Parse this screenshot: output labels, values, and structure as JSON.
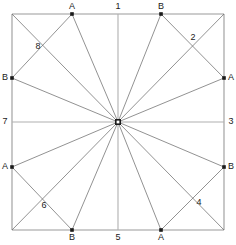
{
  "figure": {
    "type": "geometric-diagram",
    "canvas": {
      "width": 236,
      "height": 245
    },
    "colors": {
      "background": "#ffffff",
      "square_stroke": "#9a9a9a",
      "axis_stroke": "#b0b0b0",
      "ray_stroke": "#6e6e6e",
      "chord_stroke": "#6e6e6e",
      "node_fill": "#1a1a1a",
      "label_color": "#1a1a1a"
    },
    "square": {
      "left": 12,
      "top": 14,
      "right": 224,
      "bottom": 230
    },
    "center": {
      "x": 118,
      "y": 122,
      "label": ""
    }
  },
  "nodes": [
    {
      "id": "top-A",
      "label": "A",
      "x": 72,
      "y": 14,
      "lx": 72,
      "ly": 7
    },
    {
      "id": "top-B",
      "label": "B",
      "x": 161,
      "y": 14,
      "lx": 161,
      "ly": 7
    },
    {
      "id": "right-A",
      "label": "A",
      "x": 224,
      "y": 78,
      "lx": 231,
      "ly": 78
    },
    {
      "id": "right-B",
      "label": "B",
      "x": 224,
      "y": 167,
      "lx": 231,
      "ly": 167
    },
    {
      "id": "bottom-B",
      "label": "B",
      "x": 72,
      "y": 230,
      "lx": 72,
      "ly": 238
    },
    {
      "id": "bottom-A",
      "label": "A",
      "x": 161,
      "y": 230,
      "lx": 161,
      "ly": 238
    },
    {
      "id": "left-A",
      "label": "A",
      "x": 12,
      "y": 167,
      "lx": 5,
      "ly": 167
    },
    {
      "id": "left-B",
      "label": "B",
      "x": 12,
      "y": 78,
      "lx": 5,
      "ly": 78
    }
  ],
  "axis_labels": [
    {
      "id": "axis-1",
      "label": "1",
      "x": 118,
      "y": 7
    },
    {
      "id": "axis-3",
      "label": "3",
      "x": 231,
      "y": 122
    },
    {
      "id": "axis-5",
      "label": "5",
      "x": 118,
      "y": 238
    },
    {
      "id": "axis-7",
      "label": "7",
      "x": 5,
      "y": 122
    }
  ],
  "crossing_labels": [
    {
      "id": "cross-2",
      "label": "2",
      "x": 193,
      "y": 38
    },
    {
      "id": "cross-4",
      "label": "4",
      "x": 199,
      "y": 203
    },
    {
      "id": "cross-6",
      "label": "6",
      "x": 44,
      "y": 206
    },
    {
      "id": "cross-8",
      "label": "8",
      "x": 38,
      "y": 47
    }
  ],
  "axis_lines": [
    {
      "id": "vertical-axis",
      "x1": 118,
      "y1": 14,
      "x2": 118,
      "y2": 230
    },
    {
      "id": "horizontal-axis",
      "x1": 12,
      "y1": 122,
      "x2": 224,
      "y2": 122
    }
  ],
  "square_edges": [
    {
      "id": "edge-top",
      "x1": 12,
      "y1": 14,
      "x2": 224,
      "y2": 14
    },
    {
      "id": "edge-right",
      "x1": 224,
      "y1": 14,
      "x2": 224,
      "y2": 230
    },
    {
      "id": "edge-bottom",
      "x1": 12,
      "y1": 230,
      "x2": 224,
      "y2": 230
    },
    {
      "id": "edge-left",
      "x1": 12,
      "y1": 14,
      "x2": 12,
      "y2": 230
    }
  ],
  "rays": [
    {
      "id": "ray-to-top-A",
      "x1": 118,
      "y1": 122,
      "x2": 72,
      "y2": 14
    },
    {
      "id": "ray-to-top-B",
      "x1": 118,
      "y1": 122,
      "x2": 161,
      "y2": 14
    },
    {
      "id": "ray-to-right-A",
      "x1": 118,
      "y1": 122,
      "x2": 224,
      "y2": 78
    },
    {
      "id": "ray-to-right-B",
      "x1": 118,
      "y1": 122,
      "x2": 224,
      "y2": 167
    },
    {
      "id": "ray-to-bottom-B",
      "x1": 118,
      "y1": 122,
      "x2": 72,
      "y2": 230
    },
    {
      "id": "ray-to-bottom-A",
      "x1": 118,
      "y1": 122,
      "x2": 161,
      "y2": 230
    },
    {
      "id": "ray-to-left-A",
      "x1": 118,
      "y1": 122,
      "x2": 12,
      "y2": 167
    },
    {
      "id": "ray-to-left-B",
      "x1": 118,
      "y1": 122,
      "x2": 12,
      "y2": 78
    },
    {
      "id": "ray-to-corner-tl",
      "x1": 118,
      "y1": 122,
      "x2": 12,
      "y2": 14
    },
    {
      "id": "ray-to-corner-tr",
      "x1": 118,
      "y1": 122,
      "x2": 224,
      "y2": 14
    },
    {
      "id": "ray-to-corner-br",
      "x1": 118,
      "y1": 122,
      "x2": 224,
      "y2": 230
    },
    {
      "id": "ray-to-corner-bl",
      "x1": 118,
      "y1": 122,
      "x2": 12,
      "y2": 230
    }
  ],
  "chords": [
    {
      "id": "chord-left-B-to-top-A",
      "x1": 12,
      "y1": 78,
      "x2": 72,
      "y2": 14
    },
    {
      "id": "chord-top-B-to-right-A",
      "x1": 161,
      "y1": 14,
      "x2": 224,
      "y2": 78
    },
    {
      "id": "chord-right-B-to-bottom-A",
      "x1": 224,
      "y1": 167,
      "x2": 161,
      "y2": 230
    },
    {
      "id": "chord-bottom-B-to-left-A",
      "x1": 72,
      "y1": 230,
      "x2": 12,
      "y2": 167
    }
  ]
}
